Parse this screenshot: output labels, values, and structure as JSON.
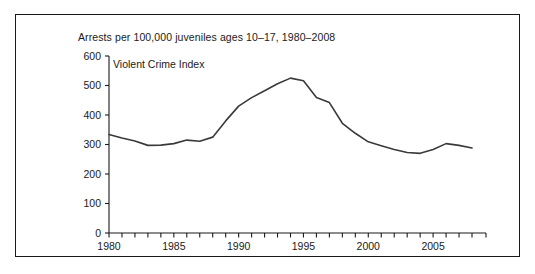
{
  "figure": {
    "title": "Arrests per 100,000 juveniles ages 10–17, 1980–2008",
    "series_label": "Violent Crime Index",
    "border_color": "#1a1a1a",
    "background_color": "#ffffff",
    "line_color": "#3a3a3a"
  },
  "chart_data": {
    "type": "line",
    "title": "Arrests per 100,000 juveniles ages 10–17, 1980–2008",
    "xlabel": "",
    "ylabel": "",
    "ylim": [
      0,
      600
    ],
    "xlim": [
      1980,
      2008
    ],
    "yticks": [
      0,
      100,
      200,
      300,
      400,
      500,
      600
    ],
    "ytick_labels": [
      "0",
      "100",
      "200",
      "300",
      "400",
      "500",
      "600"
    ],
    "xticks": [
      1980,
      1981,
      1982,
      1983,
      1984,
      1985,
      1986,
      1987,
      1988,
      1989,
      1990,
      1991,
      1992,
      1993,
      1994,
      1995,
      1996,
      1997,
      1998,
      1999,
      2000,
      2001,
      2002,
      2003,
      2004,
      2005,
      2006,
      2007,
      2008
    ],
    "xtick_labels": [
      "1980",
      "1985",
      "1990",
      "1995",
      "2000",
      "2005"
    ],
    "xtick_labeled_years": [
      1980,
      1985,
      1990,
      1995,
      2000,
      2005
    ],
    "grid": false,
    "legend": "inline",
    "x": [
      1980,
      1981,
      1982,
      1983,
      1984,
      1985,
      1986,
      1987,
      1988,
      1989,
      1990,
      1991,
      1992,
      1993,
      1994,
      1995,
      1996,
      1997,
      1998,
      1999,
      2000,
      2001,
      2002,
      2003,
      2004,
      2005,
      2006,
      2007,
      2008
    ],
    "series": [
      {
        "name": "Violent Crime Index",
        "values": [
          334,
          322,
          312,
          297,
          298,
          303,
          315,
          311,
          325,
          380,
          430,
          459,
          482,
          506,
          525,
          516,
          459,
          442,
          372,
          338,
          309,
          296,
          283,
          273,
          270,
          283,
          303,
          297,
          288
        ]
      }
    ]
  }
}
